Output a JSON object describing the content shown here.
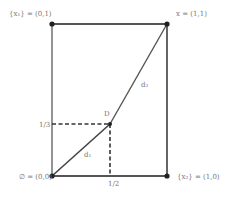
{
  "diagram": {
    "corners": {
      "top_left": {
        "label": "{x₁} = (0,1)"
      },
      "top_right": {
        "label": "x = (1,1)"
      },
      "bottom_left": {
        "label": "∅ = (0,0)"
      },
      "bottom_right": {
        "label": "{x₂} = (1,0)"
      }
    },
    "point_d": {
      "label": "D"
    },
    "segment_d1": {
      "label": "d₁"
    },
    "segment_d2": {
      "label": "d₂"
    },
    "axis_ticks": {
      "y_tick": "1/3",
      "x_tick": "1/2"
    },
    "colors": {
      "frame": "#555555",
      "line": "#444444",
      "point": "#222222",
      "text": "#777777"
    }
  }
}
